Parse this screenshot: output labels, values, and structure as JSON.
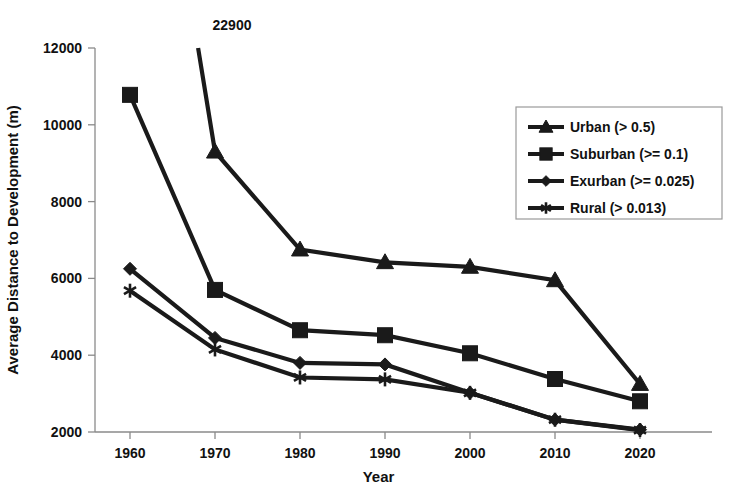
{
  "chart_data": {
    "type": "line",
    "title": "",
    "xlabel": "Year",
    "ylabel": "Average Distance to Development (m)",
    "x": [
      1960,
      1970,
      1980,
      1990,
      2000,
      2010,
      2020
    ],
    "xtick_labels": [
      "1960",
      "1970",
      "1980",
      "1990",
      "2000",
      "2010",
      "2020"
    ],
    "ytick_labels": [
      "2000",
      "4000",
      "6000",
      "8000",
      "10000",
      "12000"
    ],
    "ytick_values": [
      2000,
      4000,
      6000,
      8000,
      10000,
      12000
    ],
    "xlim": [
      1955,
      2025
    ],
    "ylim": [
      2000,
      12000
    ],
    "grid": false,
    "legend_position": "upper right",
    "annotations": [
      {
        "text": "22900",
        "x": 1960,
        "y": 22900,
        "note": "Urban 1960 value plots above the axis maximum; line is clipped at the top of the plot area"
      }
    ],
    "series": [
      {
        "name": "Urban (> 0.5)",
        "marker": "triangle",
        "values": [
          22900,
          9300,
          6750,
          6420,
          6300,
          5950,
          3250
        ]
      },
      {
        "name": "Suburban (>= 0.1)",
        "marker": "square",
        "values": [
          10780,
          5700,
          4650,
          4520,
          4050,
          3380,
          2800
        ]
      },
      {
        "name": "Exurban (>= 0.025)",
        "marker": "diamond",
        "values": [
          6250,
          4450,
          3800,
          3760,
          3020,
          2320,
          2060
        ]
      },
      {
        "name": "Rural (> 0.013)",
        "marker": "star",
        "values": [
          5680,
          4150,
          3420,
          3370,
          3020,
          2320,
          2050
        ]
      }
    ]
  },
  "legend": {
    "entries": [
      {
        "label": "Urban (> 0.5)",
        "marker": "triangle"
      },
      {
        "label": "Suburban (>= 0.1)",
        "marker": "square"
      },
      {
        "label": "Exurban (>= 0.025)",
        "marker": "diamond"
      },
      {
        "label": "Rural (> 0.013)",
        "marker": "star"
      }
    ]
  },
  "colors": {
    "series": "#1a1a1a",
    "axis": "#8a8a8a",
    "text": "#111111",
    "background": "#ffffff"
  }
}
